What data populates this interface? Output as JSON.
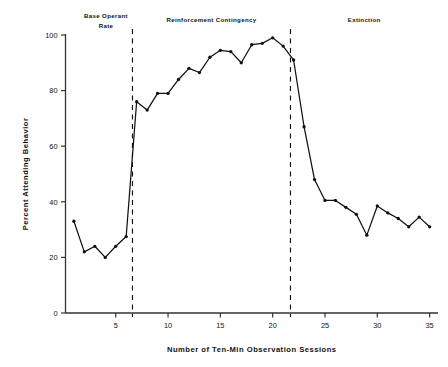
{
  "figure": {
    "background": "#ffffff",
    "line_color": "#111111",
    "marker_color": "#111111",
    "axis_color": "#333333"
  },
  "chart_data": {
    "type": "line",
    "title": "",
    "subtitle": "",
    "xlabel": "Number of Ten-Min Observation Sessions",
    "ylabel": "Percent Attending Behavior",
    "xlim": [
      0.2,
      35.8
    ],
    "ylim": [
      0,
      100
    ],
    "grid": false,
    "legend": null,
    "xticks": [
      5,
      10,
      15,
      20,
      25,
      30,
      35
    ],
    "xticklabels": [
      "5",
      "10",
      "15",
      "20",
      "25",
      "30",
      "35"
    ],
    "yticks": [
      0,
      20,
      40,
      60,
      80,
      100
    ],
    "yticklabels": [
      "0",
      "20",
      "40",
      "60",
      "80",
      "100"
    ],
    "x": [
      1,
      2,
      3,
      4,
      5,
      6,
      7,
      8,
      9,
      10,
      11,
      12,
      13,
      14,
      15,
      16,
      17,
      18,
      19,
      20,
      21,
      22,
      23,
      24,
      25,
      26,
      27,
      28,
      29,
      30,
      31,
      32,
      33,
      34,
      35
    ],
    "values": [
      33,
      22,
      24,
      20,
      24,
      27.5,
      76,
      73,
      79,
      79,
      84,
      88,
      86.5,
      92,
      94.5,
      94,
      90,
      96.5,
      97,
      99,
      96,
      91,
      67,
      48,
      40.5,
      40.5,
      38,
      35.5,
      28,
      38.5,
      36,
      34,
      31,
      34.5,
      31
    ],
    "series": [
      {
        "name": "Percent attending behavior",
        "values": [
          33,
          22,
          24,
          20,
          24,
          27.5,
          76,
          73,
          79,
          79,
          84,
          88,
          86.5,
          92,
          94.5,
          94,
          90,
          96.5,
          97,
          99,
          96,
          91,
          67,
          48,
          40.5,
          40.5,
          38,
          35.5,
          28,
          38.5,
          36,
          34,
          31,
          34.5,
          31
        ]
      }
    ],
    "phases": [
      {
        "name": "base-operant-rate",
        "label_line1": "Base Operant",
        "label_line2": "Rate",
        "x_start": 0.2,
        "x_end": 6.6
      },
      {
        "name": "reinforcement-contingency",
        "label_line1": "Reinforcement Contingency",
        "label_line2": "",
        "x_start": 6.6,
        "x_end": 21.7
      },
      {
        "name": "extinction",
        "label_line1": "Extinction",
        "label_line2": "",
        "x_start": 21.7,
        "x_end": 35.8
      }
    ],
    "phase_dividers": [
      {
        "name": "divider-baseline-reinforcement",
        "x": 6.6,
        "style": "dashed"
      },
      {
        "name": "divider-reinforcement-extinction",
        "x": 21.7,
        "style": "dashed"
      }
    ],
    "annotations": []
  }
}
